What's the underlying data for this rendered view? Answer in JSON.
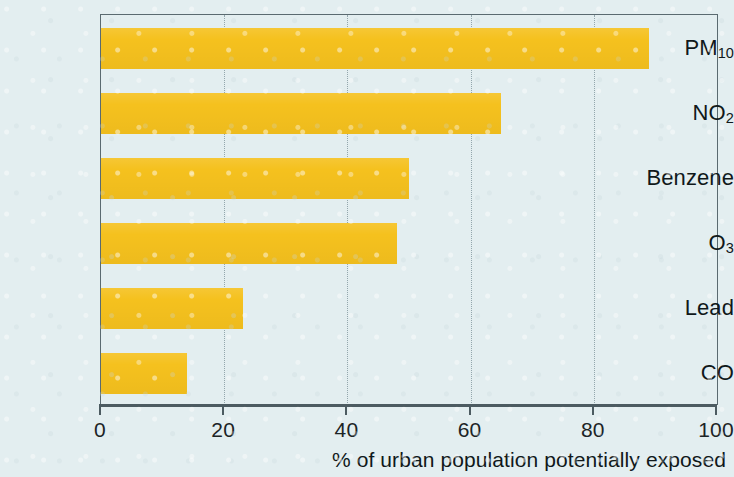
{
  "chart_data": {
    "type": "bar",
    "orientation": "horizontal",
    "title": "",
    "xlabel": "% of urban population potentially exposed",
    "ylabel": "",
    "categories": [
      "PM10",
      "NO2",
      "Benzene",
      "O3",
      "Lead",
      "CO"
    ],
    "category_labels_html": [
      "PM<sub>10</sub>",
      "NO<sub>2</sub>",
      "Benzene",
      "O<sub>3</sub>",
      "Lead",
      "CO"
    ],
    "values": [
      89,
      65,
      50,
      48,
      23,
      14
    ],
    "xlim": [
      0,
      100
    ],
    "xticks": [
      0,
      20,
      40,
      60,
      80,
      100
    ],
    "xtick_labels": [
      "0",
      "20",
      "40",
      "60",
      "80",
      "100"
    ],
    "grid": true,
    "grid_axis": "x",
    "grid_style": "dotted",
    "legend": false,
    "bar_color": "#F5C11E",
    "background_color": "#E3EEF0",
    "axis_color": "#4C5B61",
    "text_color": "#10181A"
  },
  "axis": {
    "x_title": "% of urban population potentially exposed"
  }
}
